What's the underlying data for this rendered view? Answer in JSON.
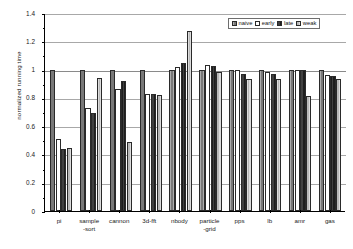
{
  "chart_data": {
    "type": "bar",
    "title": "",
    "xlabel": "",
    "ylabel": "normalized running time",
    "ylim": [
      0,
      1.4
    ],
    "ytick_labels": [
      "0",
      "0.2",
      "0.4",
      "0.6",
      "0.8",
      "1",
      "1.2",
      "1.4"
    ],
    "ytick_values": [
      0,
      0.2,
      0.4,
      0.6,
      0.8,
      1.0,
      1.2,
      1.4
    ],
    "grid": true,
    "legend_position": "top-right",
    "categories": [
      "pi",
      "sample -sort",
      "cannon",
      "3d-fft",
      "nbody",
      "particle -grid",
      "pps",
      "lb",
      "amr",
      "gas"
    ],
    "category_lines": [
      [
        "pi",
        ""
      ],
      [
        "sample",
        "-sort"
      ],
      [
        "cannon",
        ""
      ],
      [
        "3d-fft",
        ""
      ],
      [
        "nbody",
        ""
      ],
      [
        "particle",
        "-grid"
      ],
      [
        "pps",
        ""
      ],
      [
        "lb",
        ""
      ],
      [
        "amr",
        ""
      ],
      [
        "gas",
        ""
      ]
    ],
    "series": [
      {
        "name": "naive",
        "color": "#9a9a9a",
        "values": [
          1.0,
          1.0,
          1.0,
          1.0,
          1.0,
          1.0,
          1.0,
          1.0,
          1.0,
          1.0
        ]
      },
      {
        "name": "early",
        "color": "#ffffff",
        "values": [
          0.51,
          0.73,
          0.86,
          0.83,
          1.02,
          1.035,
          1.0,
          0.98,
          1.0,
          0.96
        ]
      },
      {
        "name": "late",
        "color": "#2b2b2b",
        "values": [
          0.44,
          0.69,
          0.92,
          0.825,
          1.05,
          1.025,
          0.97,
          0.97,
          1.0,
          0.955
        ]
      },
      {
        "name": "weak",
        "color": "#cdcdcd",
        "values": [
          0.445,
          0.94,
          0.49,
          0.82,
          1.27,
          0.98,
          0.935,
          0.93,
          0.81,
          0.93
        ]
      }
    ]
  }
}
